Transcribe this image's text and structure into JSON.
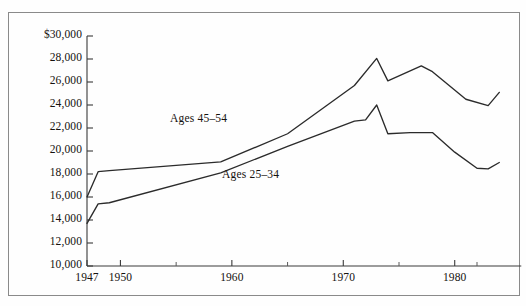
{
  "chart_data": {
    "type": "line",
    "title": "",
    "subtitle": "",
    "xlabel": "",
    "ylabel": "",
    "xlim": [
      1947,
      1984
    ],
    "ylim": [
      10000,
      30000
    ],
    "grid": false,
    "legend_position": "inline-annotations",
    "y_tick_labels": [
      "$30,000",
      "28,000",
      "26,000",
      "24,000",
      "22,000",
      "20,000",
      "18,000",
      "16,000",
      "14,000",
      "12,000",
      "10,000"
    ],
    "y_ticks": [
      30000,
      28000,
      26000,
      24000,
      22000,
      20000,
      18000,
      16000,
      14000,
      12000,
      10000
    ],
    "x_tick_labels": [
      "1947",
      "1950",
      "1960",
      "1970",
      "1980"
    ],
    "x_ticks": [
      1947,
      1950,
      1960,
      1970,
      1980
    ],
    "x_minor_ticks": [
      1955,
      1965,
      1975,
      1982
    ],
    "series": [
      {
        "name": "Ages 45-54",
        "label": "Ages  45–54",
        "label_x": 170,
        "label_y": 112,
        "x": [
          1947,
          1948,
          1949,
          1959,
          1965,
          1971,
          1973,
          1974,
          1977,
          1978,
          1981,
          1983,
          1984
        ],
        "values": [
          16000,
          18200,
          18300,
          19050,
          21500,
          25700,
          28050,
          26100,
          27400,
          26900,
          24500,
          23950,
          25100
        ]
      },
      {
        "name": "Ages 25-34",
        "label": "Ages  25–34",
        "label_x": 222,
        "label_y": 168,
        "x": [
          1947,
          1948,
          1949,
          1959,
          1965,
          1971,
          1972,
          1973,
          1974,
          1976,
          1978,
          1980,
          1982,
          1983,
          1984
        ],
        "values": [
          13700,
          15400,
          15500,
          18100,
          20400,
          22600,
          22700,
          24000,
          21500,
          21600,
          21600,
          19900,
          18500,
          18450,
          19000
        ]
      }
    ]
  },
  "colors": {
    "line": "#2b2b2b",
    "axis": "#3a3a3a",
    "frame": "#8a8a8a",
    "background": "#fefefe",
    "text": "#15110e"
  }
}
